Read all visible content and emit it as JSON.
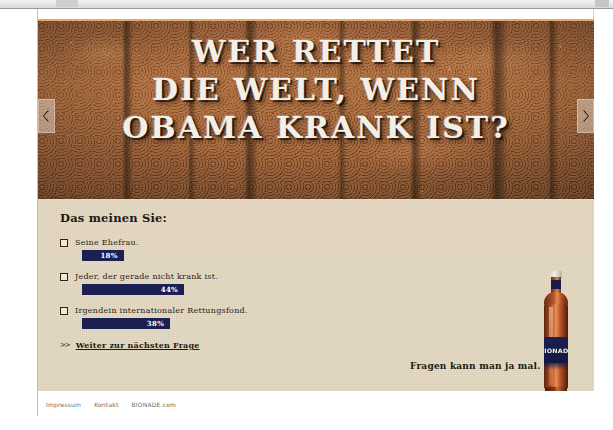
{
  "window": {
    "title": ""
  },
  "hero": {
    "headline_lines": [
      "WER RETTET",
      "DIE WELT, WENN",
      "OBAMA KRANK IST?"
    ],
    "prev_arrow_label": "‹",
    "next_arrow_label": "›"
  },
  "poll": {
    "heading": "Das meinen Sie:",
    "options": [
      {
        "label": "Seine Ehefrau.",
        "percent_label": "18%",
        "percent": 18
      },
      {
        "label": "Jeder, der gerade nicht krank ist.",
        "percent_label": "44%",
        "percent": 44
      },
      {
        "label": "Irgendein internationaler Rettungsfond.",
        "percent_label": "38%",
        "percent": 38
      }
    ],
    "next_chevrons": ">>",
    "next_label": "Weiter zur nächsten Frage"
  },
  "tagline": "Fragen kann man ja mal.",
  "bottle": {
    "label_text": "BIONADE"
  },
  "footer": {
    "links": [
      "Impressum",
      "Kontakt",
      "BIONADE.com"
    ]
  },
  "colors": {
    "paper": "#e6dcc8",
    "bar_navy": "#1b1f52",
    "top_rule": "#e8a86a",
    "ink": "#2b2319"
  }
}
